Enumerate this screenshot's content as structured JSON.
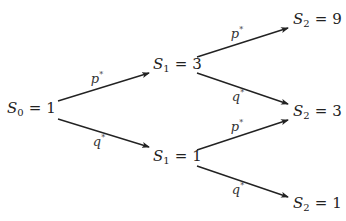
{
  "diagram": {
    "type": "binomial-tree",
    "colors": {
      "arrow": "#222222",
      "text": "#222222"
    },
    "nodes": [
      {
        "id": "s0",
        "var": "S",
        "sub": "0",
        "value": "1"
      },
      {
        "id": "s1_up",
        "var": "S",
        "sub": "1",
        "value": "3"
      },
      {
        "id": "s1_down",
        "var": "S",
        "sub": "1",
        "value": "1"
      },
      {
        "id": "s2_uu",
        "var": "S",
        "sub": "2",
        "value": "9"
      },
      {
        "id": "s2_ud",
        "var": "S",
        "sub": "2",
        "value": "3"
      },
      {
        "id": "s2_dd",
        "var": "S",
        "sub": "2",
        "value": "1"
      }
    ],
    "edges": [
      {
        "from": "s0",
        "to": "s1_up",
        "label": "p",
        "label_sup": "*"
      },
      {
        "from": "s0",
        "to": "s1_down",
        "label": "q",
        "label_sup": "*"
      },
      {
        "from": "s1_up",
        "to": "s2_uu",
        "label": "p",
        "label_sup": "*"
      },
      {
        "from": "s1_up",
        "to": "s2_ud",
        "label": "q",
        "label_sup": "*"
      },
      {
        "from": "s1_down",
        "to": "s2_ud",
        "label": "p",
        "label_sup": "*"
      },
      {
        "from": "s1_down",
        "to": "s2_dd",
        "label": "q",
        "label_sup": "*"
      }
    ],
    "equals_sign": "="
  }
}
